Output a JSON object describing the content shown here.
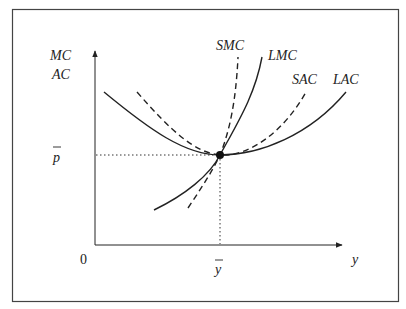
{
  "figure": {
    "frame_color": "#444444",
    "line_color": "#222222",
    "axes": {
      "y_label_line1": "MC",
      "y_label_line2": "AC",
      "x_label": "y",
      "origin_label": "0",
      "price_level_label": "p",
      "quantity_level_label": "y"
    },
    "curves": [
      {
        "name": "SMC",
        "label": "SMC",
        "style": "dashed"
      },
      {
        "name": "LMC",
        "label": "LMC",
        "style": "solid"
      },
      {
        "name": "SAC",
        "label": "SAC",
        "style": "dashed"
      },
      {
        "name": "LAC",
        "label": "LAC",
        "style": "solid"
      }
    ],
    "tangency_point": {
      "x_label": "y-bar",
      "y_label": "p-bar"
    }
  }
}
